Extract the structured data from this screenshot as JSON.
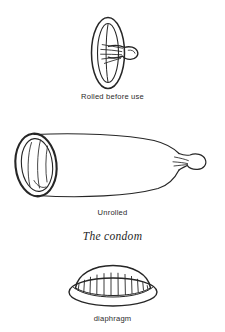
{
  "page": {
    "title": "The condom",
    "background_color": "#ffffff",
    "ink_color": "#262626",
    "width": 225,
    "height": 332
  },
  "figures": [
    {
      "id": "rolled",
      "name": "rolled-condom-illustration",
      "icon": "rolled-condom-icon",
      "caption": "Rolled before use",
      "description": "Condom rolled into a flat ring with the teat protruding to the right"
    },
    {
      "id": "unrolled",
      "name": "unrolled-condom-illustration",
      "icon": "unrolled-condom-icon",
      "caption": "Unrolled",
      "description": "Condom unrolled into a tapered sheath with open ring at left and reservoir tip at right"
    },
    {
      "id": "diaphragm",
      "name": "diaphragm-illustration",
      "icon": "diaphragm-icon",
      "caption": "diaphragm",
      "description": "Domed diaphragm with pleated membrane seated in a flexible elliptical rim"
    }
  ],
  "plate_title": "The condom"
}
